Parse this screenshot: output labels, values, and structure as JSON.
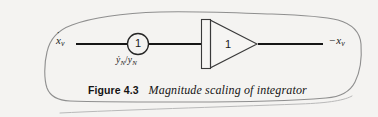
{
  "figure": {
    "caption_number": "Figure 4.3",
    "caption_title": "Magnitude scaling of integrator",
    "background_color": "#f4f3f1",
    "line_color": "#1a1a1a",
    "outline_color": "#8a8a8a"
  },
  "diagram": {
    "input_signal": {
      "symbol": "x",
      "accent": "˙",
      "subscript": "v",
      "sign": ""
    },
    "output_signal": {
      "symbol": "x",
      "accent": "",
      "subscript": "v",
      "sign": "−"
    },
    "potentiometer": {
      "value": "1",
      "gain_numerator": "ẏ",
      "gain_numerator_sub": "N",
      "gain_divider": "/",
      "gain_denominator": "y",
      "gain_denominator_sub": "N"
    },
    "integrator": {
      "value": "1",
      "shape": "triangle-with-double-bar"
    }
  }
}
